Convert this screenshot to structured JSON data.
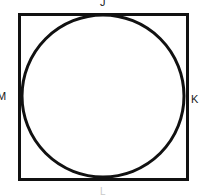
{
  "figure": {
    "background_color": "#ffffff",
    "stroke_color": "#111111",
    "fill_color": "#ffffff",
    "labels": {
      "top": "J",
      "right": "K",
      "bottom": "L",
      "left": "M"
    },
    "shapes": {
      "square": {
        "name": "square",
        "x": 19,
        "y": 14,
        "width": 168,
        "height": 165,
        "stroke_width": 3
      },
      "circle": {
        "name": "inscribed-circle",
        "cx": 103,
        "cy": 96,
        "r": 81,
        "stroke_width": 3
      }
    }
  }
}
